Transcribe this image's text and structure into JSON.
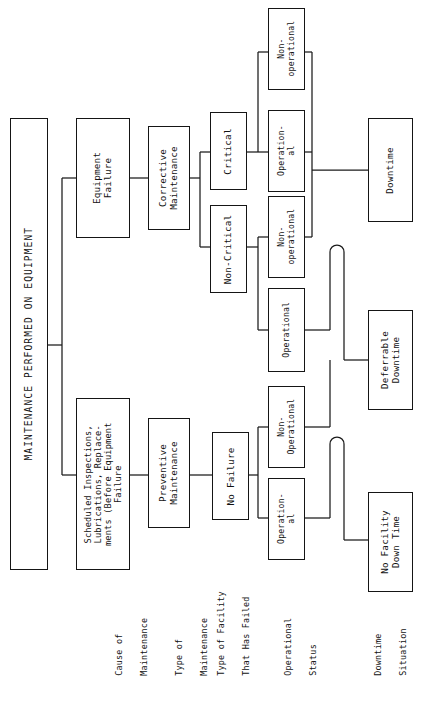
{
  "diagram": {
    "title": "MAINTENANCE PERFORMED ON EQUIPMENT",
    "orientation": "rotated-90-ccw",
    "root": {
      "label": "MAINTENANCE PERFORMED ON EQUIPMENT"
    },
    "row_labels": [
      {
        "id": "cause-of-maintenance",
        "line1": "Cause of",
        "line2": "Maintenance"
      },
      {
        "id": "type-of-maintenance",
        "line1": "Type of",
        "line2": "Maintenance"
      },
      {
        "id": "type-of-facility-that-has-failed",
        "line1": "Type of Facility",
        "line2": "That Has Failed"
      },
      {
        "id": "operational-status",
        "line1": "Operational",
        "line2": "Status"
      },
      {
        "id": "downtime-situation",
        "line1": "Downtime",
        "line2": "Situation"
      }
    ],
    "cause": [
      {
        "id": "equipment-failure",
        "label": "Equipment\nFailure"
      },
      {
        "id": "scheduled-inspections",
        "label": "Scheduled Inspections,\nLubrications, Replace-\nments (Before Equipment\nFailure"
      }
    ],
    "maintenance_type": [
      {
        "id": "corrective-maintenance",
        "label": "Corrective\nMaintenance"
      },
      {
        "id": "preventive-maintenance",
        "label": "Preventive\nMaintenance"
      }
    ],
    "facility_type": [
      {
        "id": "critical",
        "label": "Critical"
      },
      {
        "id": "non-critical",
        "label": "Non-Critical"
      },
      {
        "id": "no-failure",
        "label": "No Failure"
      }
    ],
    "operational_status": [
      {
        "id": "critical-non-operational",
        "label": "Non-\noperational"
      },
      {
        "id": "critical-operational",
        "label": "Operation-\nal"
      },
      {
        "id": "noncritical-non-operational",
        "label": "Non-\noperational"
      },
      {
        "id": "noncritical-operational",
        "label": "Operational"
      },
      {
        "id": "nofailure-non-operational",
        "label": "Non-\nOperational"
      },
      {
        "id": "nofailure-operational",
        "label": "Operation-\nal"
      }
    ],
    "downtime": [
      {
        "id": "downtime",
        "label": "Downtime"
      },
      {
        "id": "deferrable-downtime",
        "label": "Deferrable\nDowntime"
      },
      {
        "id": "no-facility-down-time",
        "label": "No Facility\nDown Time"
      }
    ],
    "colors": {
      "line": "#1a1a1a",
      "box_border": "#151515",
      "background": "#ffffff",
      "text": "#111111"
    }
  }
}
